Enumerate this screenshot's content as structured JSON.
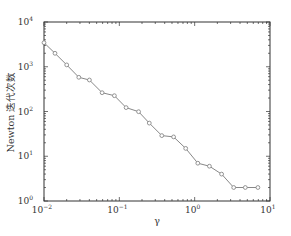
{
  "chart_data": {
    "type": "line",
    "title": "",
    "xlabel": "γ",
    "ylabel": "Newton 迭代次数",
    "xscale": "log",
    "yscale": "log",
    "xlim": [
      0.01,
      10
    ],
    "ylim": [
      1,
      10000
    ],
    "grid": false,
    "legend": null,
    "x_ticks": [
      {
        "base": "10",
        "exp": "−2",
        "value": 0.01
      },
      {
        "base": "10",
        "exp": "−1",
        "value": 0.1
      },
      {
        "base": "10",
        "exp": "0",
        "value": 1
      },
      {
        "base": "10",
        "exp": "1",
        "value": 10
      }
    ],
    "y_ticks": [
      {
        "base": "10",
        "exp": "0",
        "value": 1
      },
      {
        "base": "10",
        "exp": "1",
        "value": 10
      },
      {
        "base": "10",
        "exp": "2",
        "value": 100
      },
      {
        "base": "10",
        "exp": "3",
        "value": 1000
      },
      {
        "base": "10",
        "exp": "4",
        "value": 10000
      }
    ],
    "series": [
      {
        "name": "Newton iterations",
        "color": "#888888",
        "marker": "circle",
        "x": [
          0.01,
          0.014,
          0.02,
          0.029,
          0.04,
          0.059,
          0.086,
          0.123,
          0.18,
          0.25,
          0.366,
          0.526,
          0.76,
          1.1,
          1.57,
          2.28,
          3.3,
          4.7,
          6.9
        ],
        "values": [
          3450,
          2000,
          1100,
          580,
          505,
          263,
          225,
          122,
          99,
          55,
          29,
          27,
          15,
          7,
          6,
          4,
          2,
          2,
          2
        ]
      }
    ]
  }
}
